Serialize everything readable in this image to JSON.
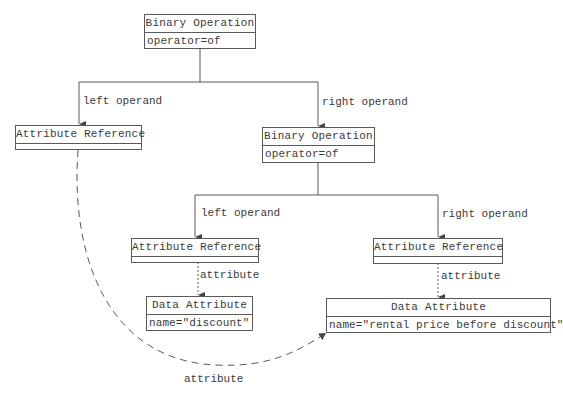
{
  "diagram": {
    "nodes": {
      "root": {
        "title": "Binary Operation",
        "attribute": "operator=of"
      },
      "left_ref": {
        "title": "Attribute Reference",
        "attribute": ""
      },
      "right_op": {
        "title": "Binary Operation",
        "attribute": "operator=of"
      },
      "mid_ref": {
        "title": "Attribute Reference",
        "attribute": ""
      },
      "right_ref": {
        "title": "Attribute Reference",
        "attribute": ""
      },
      "discount_attr": {
        "title": "Data Attribute",
        "attribute": "name=\"discount\""
      },
      "rental_attr": {
        "title": "Data Attribute",
        "attribute": "name=\"rental price before discount\""
      }
    },
    "edges": {
      "root_left": {
        "label": "left operand",
        "style": "solid"
      },
      "root_right": {
        "label": "right operand",
        "style": "solid"
      },
      "op_left": {
        "label": "left operand",
        "style": "solid"
      },
      "op_right": {
        "label": "right operand",
        "style": "solid"
      },
      "mid_attr": {
        "label": "attribute",
        "style": "dotted"
      },
      "right_attr": {
        "label": "attribute",
        "style": "dotted"
      },
      "left_curve_attr": {
        "label": "attribute",
        "style": "dashed"
      }
    },
    "colors": {
      "line": "#5a5a5a",
      "text": "#3a3a3a",
      "background": "#ffffff"
    }
  }
}
